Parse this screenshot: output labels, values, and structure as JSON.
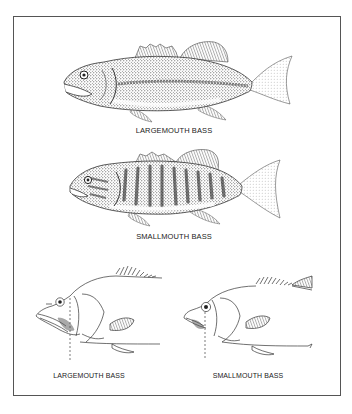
{
  "figure": {
    "panels": [
      {
        "id": "largemouth-full",
        "label": "LARGEMOUTH BASS",
        "style": "stippled illustration"
      },
      {
        "id": "smallmouth-full",
        "label": "SMALLMOUTH BASS",
        "style": "stippled illustration with vertical bars"
      }
    ],
    "head_comparison": [
      {
        "id": "largemouth-head",
        "label": "LARGEMOUTH BASS",
        "note": "jaw extends beyond eye"
      },
      {
        "id": "smallmouth-head",
        "label": "SMALLMOUTH BASS",
        "note": "jaw ends below eye"
      }
    ]
  },
  "colors": {
    "border": "#555555",
    "ink": "#222222",
    "stipple": "#3a3a3a",
    "background": "#ffffff"
  }
}
